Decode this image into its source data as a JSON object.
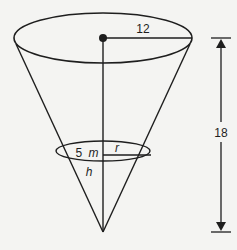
{
  "diagram": {
    "type": "inverted-cone-tank",
    "colors": {
      "background": "#f4f4f2",
      "stroke": "#1e1e1e"
    },
    "labels": {
      "top_radius": "12",
      "height_total": "18",
      "water_radius": "r",
      "water_depth_value": "5 m",
      "water_depth_num": "5",
      "water_depth_unit": "m",
      "water_height_var": "h"
    },
    "geometry": {
      "top_ellipse": {
        "cx": 103,
        "cy": 38,
        "rx": 89,
        "ry": 25
      },
      "inner_ellipse": {
        "cx": 103,
        "cy": 151,
        "rx": 47,
        "ry": 10
      },
      "apex": {
        "x": 103,
        "y": 232
      },
      "dimension_line": {
        "x": 221,
        "y_top": 38,
        "y_bottom": 232
      }
    }
  }
}
